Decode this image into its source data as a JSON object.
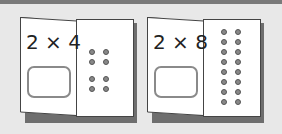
{
  "cards": [
    {
      "expression": "2 × 4",
      "factor_a": 2,
      "factor_b": 4,
      "dot_rows": 4,
      "dot_columns": 2,
      "answer": ""
    },
    {
      "expression": "2 × 8",
      "factor_a": 2,
      "factor_b": 8,
      "dot_rows": 8,
      "dot_columns": 2,
      "answer": ""
    }
  ],
  "colors": {
    "background": "#e8e8e8",
    "topbar": "#7a7a7a",
    "card": "#ffffff",
    "shadow": "#6e6e6e",
    "dot": "#888888"
  }
}
